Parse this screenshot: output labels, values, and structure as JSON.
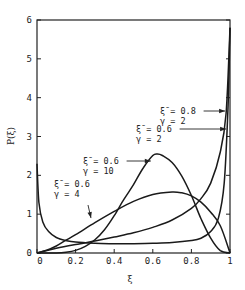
{
  "chart_data": {
    "type": "line",
    "title": "",
    "xlabel": "ξ",
    "ylabel": "P(ξ)",
    "xlim": [
      0,
      1
    ],
    "ylim": [
      0,
      6
    ],
    "grid": false,
    "x_ticks": [
      "0",
      "0.2",
      "0.4",
      "0.6",
      "0.8",
      "1"
    ],
    "y_ticks": [
      "0",
      "1",
      "2",
      "3",
      "4",
      "5",
      "6"
    ],
    "series": [
      {
        "name": "ξ̄ = 0.6, γ = 10",
        "x": [
          0,
          0.05,
          0.1,
          0.15,
          0.2,
          0.25,
          0.3,
          0.35,
          0.4,
          0.45,
          0.5,
          0.55,
          0.6,
          0.625,
          0.65,
          0.7,
          0.75,
          0.8,
          0.85,
          0.9,
          0.95,
          1
        ],
        "values": [
          0,
          0.0,
          0.003,
          0.02,
          0.066,
          0.17,
          0.34,
          0.6,
          0.96,
          1.38,
          1.76,
          2.19,
          2.51,
          2.55,
          2.51,
          2.33,
          1.98,
          1.48,
          0.88,
          0.38,
          0.06,
          0
        ]
      },
      {
        "name": "ξ̄ = 0.6, γ = 4",
        "x": [
          0,
          0.05,
          0.1,
          0.15,
          0.2,
          0.3,
          0.4,
          0.5,
          0.6,
          0.7,
          0.75,
          0.8,
          0.85,
          0.9,
          0.95,
          1
        ],
        "values": [
          0,
          0.07,
          0.18,
          0.33,
          0.47,
          0.78,
          1.07,
          1.33,
          1.51,
          1.57,
          1.55,
          1.47,
          1.31,
          1.05,
          0.7,
          0
        ]
      },
      {
        "name": "ξ̄ = 0.6, γ = 2",
        "x": [
          0,
          0.1,
          0.2,
          0.3,
          0.4,
          0.5,
          0.6,
          0.7,
          0.8,
          0.85,
          0.9,
          0.95,
          0.98,
          1
        ],
        "values": [
          0,
          0.12,
          0.22,
          0.31,
          0.41,
          0.52,
          0.66,
          0.85,
          1.15,
          1.4,
          1.8,
          2.6,
          3.6,
          5.8
        ]
      },
      {
        "name": "ξ̄ = 0.8, γ = 2",
        "x": [
          0,
          0.01,
          0.03,
          0.06,
          0.1,
          0.15,
          0.2,
          0.3,
          0.4,
          0.5,
          0.6,
          0.7,
          0.8,
          0.85,
          0.9,
          0.94,
          0.97,
          0.99,
          1
        ],
        "values": [
          2.3,
          1.3,
          0.8,
          0.55,
          0.4,
          0.32,
          0.28,
          0.25,
          0.24,
          0.24,
          0.25,
          0.27,
          0.32,
          0.38,
          0.55,
          0.9,
          1.8,
          3.8,
          5.8
        ]
      }
    ],
    "annotations": [
      {
        "lines": [
          "ξ̄ = 0.8",
          "γ = 2"
        ],
        "arrow_to": [
          0.985,
          3.75
        ]
      },
      {
        "lines": [
          "ξ̄ = 0.6",
          "γ = 2"
        ],
        "arrow_to": [
          0.99,
          3.15
        ]
      },
      {
        "lines": [
          "ξ̄ = 0.6",
          "γ = 10"
        ],
        "arrow_to": [
          0.6,
          2.45
        ]
      },
      {
        "lines": [
          "ξ̄ = 0.6",
          "γ = 4"
        ],
        "arrow_to": [
          0.29,
          0.9
        ]
      }
    ]
  }
}
